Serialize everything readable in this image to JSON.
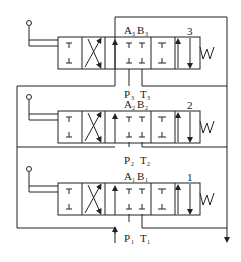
{
  "diagram": {
    "valves": [
      {
        "id": "3",
        "number": "3",
        "ports_top": {
          "a": "A",
          "a_sub": "3",
          "b": "B",
          "b_sub": "3"
        },
        "ports_bottom": {
          "p": "P",
          "p_sub": "3",
          "t": "T",
          "t_sub": "3"
        },
        "spring_label": "W"
      },
      {
        "id": "2",
        "number": "2",
        "ports_top": {
          "a": "A",
          "a_sub": "2",
          "b": "B",
          "b_sub": "2"
        },
        "ports_bottom": {
          "p": "P",
          "p_sub": "2",
          "t": "T",
          "t_sub": "2"
        },
        "spring_label": "W"
      },
      {
        "id": "1",
        "number": "1",
        "ports_top": {
          "a": "A",
          "a_sub": "1",
          "b": "B",
          "b_sub": "1"
        },
        "ports_bottom": {
          "p": "P",
          "p_sub": "1",
          "t": "T",
          "t_sub": "1"
        },
        "spring_label": "W"
      }
    ],
    "line_color": "#222222",
    "background": "#ffffff"
  }
}
